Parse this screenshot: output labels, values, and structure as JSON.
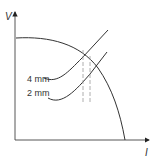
{
  "diagram": {
    "type": "line-diagram",
    "axes": {
      "y_label": "V",
      "x_label": "I"
    },
    "curves": [
      {
        "name": "power-source-characteristic",
        "description": "falling V-I characteristic curve"
      },
      {
        "name": "arc-characteristic-4mm",
        "label": "4 mm"
      },
      {
        "name": "arc-characteristic-2mm",
        "label": "2 mm"
      }
    ],
    "markers": [
      {
        "name": "operating-point-4mm",
        "style": "dashed vertical line"
      },
      {
        "name": "operating-point-2mm",
        "style": "dashed vertical line"
      }
    ],
    "colors": {
      "line": "#333333",
      "dashed": "#999999",
      "background": "#ffffff"
    }
  }
}
